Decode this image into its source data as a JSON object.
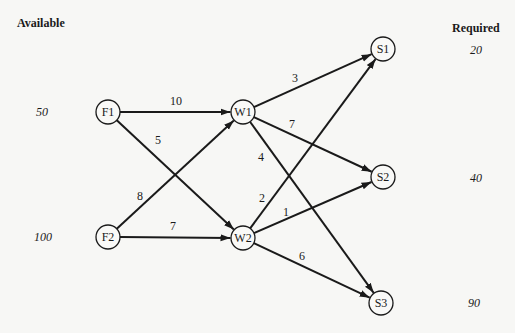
{
  "headers": {
    "available": "Available",
    "required": "Required"
  },
  "supply": [
    {
      "node": "F1",
      "value": "50"
    },
    {
      "node": "F2",
      "value": "100"
    }
  ],
  "demand": [
    {
      "node": "S1",
      "value": "20"
    },
    {
      "node": "S2",
      "value": "40"
    },
    {
      "node": "S3",
      "value": "90"
    }
  ],
  "nodes": [
    {
      "id": "F1",
      "label": "F1",
      "x": 108,
      "y": 112
    },
    {
      "id": "F2",
      "label": "F2",
      "x": 108,
      "y": 237
    },
    {
      "id": "W1",
      "label": "W1",
      "x": 243,
      "y": 112
    },
    {
      "id": "W2",
      "label": "W2",
      "x": 243,
      "y": 238
    },
    {
      "id": "S1",
      "label": "S1",
      "x": 383,
      "y": 49
    },
    {
      "id": "S2",
      "label": "S2",
      "x": 383,
      "y": 177
    },
    {
      "id": "S3",
      "label": "S3",
      "x": 381,
      "y": 303
    }
  ],
  "edges": [
    {
      "from": "F1",
      "to": "W1",
      "cost": "10",
      "lx": 170,
      "ly": 105
    },
    {
      "from": "F1",
      "to": "W2",
      "cost": "5",
      "lx": 155,
      "ly": 144
    },
    {
      "from": "F2",
      "to": "W1",
      "cost": "8",
      "lx": 137,
      "ly": 200
    },
    {
      "from": "F2",
      "to": "W2",
      "cost": "7",
      "lx": 170,
      "ly": 230
    },
    {
      "from": "W1",
      "to": "S1",
      "cost": "3",
      "lx": 292,
      "ly": 82
    },
    {
      "from": "W1",
      "to": "S2",
      "cost": "7",
      "lx": 289,
      "ly": 128
    },
    {
      "from": "W1",
      "to": "S3",
      "cost": "4",
      "lx": 258,
      "ly": 161
    },
    {
      "from": "W2",
      "to": "S1",
      "cost": "2",
      "lx": 259,
      "ly": 202
    },
    {
      "from": "W2",
      "to": "S2",
      "cost": "1",
      "lx": 283,
      "ly": 216
    },
    {
      "from": "W2",
      "to": "S3",
      "cost": "6",
      "lx": 299,
      "ly": 260
    }
  ]
}
